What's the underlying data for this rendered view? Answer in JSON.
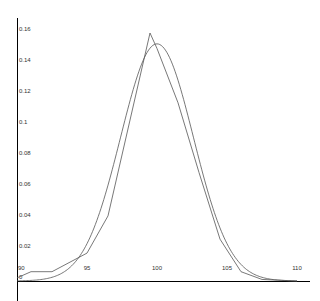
{
  "chart_data": {
    "type": "line",
    "title": "",
    "xlabel": "",
    "ylabel": "",
    "xlim": [
      90,
      110
    ],
    "ylim": [
      0,
      0.16
    ],
    "grid": false,
    "legend": null,
    "x_ticks": [
      "90",
      "95",
      "100",
      "105",
      "110"
    ],
    "y_ticks": [
      "0",
      "0.02",
      "0.04",
      "0.06",
      "0.08",
      "0.1",
      "0.12",
      "0.14",
      "0.16"
    ],
    "series": [
      {
        "name": "empirical",
        "style": "polyline",
        "x": [
          90,
          91,
          92.5,
          95,
          96.5,
          99.5,
          100,
          101.5,
          103,
          104.5,
          106,
          107.5,
          110
        ],
        "y": [
          0.002,
          0.006,
          0.006,
          0.018,
          0.042,
          0.16,
          0.15,
          0.115,
          0.07,
          0.027,
          0.006,
          0.001,
          0
        ]
      },
      {
        "name": "normal fit",
        "style": "smooth",
        "mean": 100,
        "sd": 2.6,
        "peak": 0.153
      }
    ]
  },
  "colors": {
    "axis": "#000000",
    "line": "#555555"
  }
}
